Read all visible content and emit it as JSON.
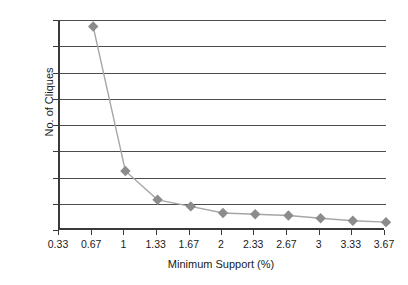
{
  "chart_data": {
    "type": "line",
    "title": "",
    "xlabel": "Minimum Support (%)",
    "ylabel": "No. of Cliques",
    "x": [
      0.33,
      0.67,
      1,
      1.33,
      1.67,
      2,
      2.33,
      2.67,
      3,
      3.33,
      3.67
    ],
    "xtick_labels": [
      "0.33",
      "0.67",
      "1",
      "1.33",
      "1.67",
      "2",
      "2.33",
      "2.67",
      "3",
      "3.33",
      "3.67"
    ],
    "xlim": [
      0.33,
      3.67
    ],
    "ylim": [
      0,
      160
    ],
    "ytick_labels": [
      "0",
      "20",
      "40",
      "60",
      "80",
      "100",
      "120",
      "140",
      "160"
    ],
    "ytick_values": [
      0,
      20,
      40,
      60,
      80,
      100,
      120,
      140,
      160
    ],
    "grid": "horizontal",
    "legend": "none",
    "series": [
      {
        "name": "No. of Cliques",
        "marker": "diamond",
        "marker_color": "#8c8c8c",
        "line_color": "#a6a6a6",
        "points": [
          {
            "x": 0.67,
            "y": 155
          },
          {
            "x": 1,
            "y": 45
          },
          {
            "x": 1.33,
            "y": 23
          },
          {
            "x": 1.67,
            "y": 18
          },
          {
            "x": 2,
            "y": 13
          },
          {
            "x": 2.33,
            "y": 12
          },
          {
            "x": 2.67,
            "y": 11
          },
          {
            "x": 3,
            "y": 9
          },
          {
            "x": 3.33,
            "y": 7
          },
          {
            "x": 3.67,
            "y": 6
          }
        ]
      }
    ]
  }
}
